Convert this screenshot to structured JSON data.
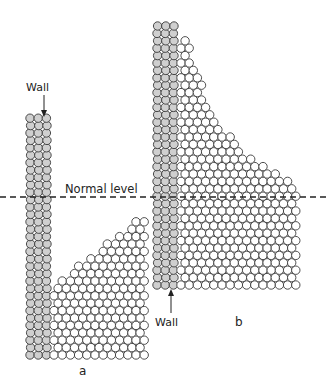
{
  "figure": {
    "labels": {
      "wall_a": "Wall",
      "wall_b": "Wall",
      "normal_level": "Normal level",
      "panel_a": "a",
      "panel_b": "b"
    },
    "colors": {
      "wall_fill": "#cfcfcf",
      "particle_fill": "#ffffff",
      "stroke": "#3a3a3a",
      "background": "#ffffff"
    },
    "normal_level_y": 197,
    "panel_a": {
      "wall": {
        "x": 30,
        "top": 118,
        "bottom": 355,
        "cols": 3
      },
      "pile": {
        "x_left": 54,
        "x_right": 148,
        "bottom": 355,
        "top_left": 285,
        "top_right": 215
      }
    },
    "panel_b": {
      "wall": {
        "x": 157,
        "top": 25,
        "bottom": 285,
        "cols": 3
      },
      "pile": {
        "x_left": 181,
        "x_right": 297,
        "bottom": 285,
        "curve": "hyperbolic"
      }
    }
  }
}
